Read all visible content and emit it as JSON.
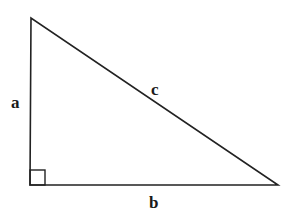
{
  "diagram": {
    "type": "right-triangle",
    "labels": {
      "a": "a",
      "b": "b",
      "c": "c"
    },
    "vertices": {
      "top": [
        31,
        18
      ],
      "right_angle": [
        30,
        185
      ],
      "right": [
        278,
        185
      ]
    },
    "stroke_color": "#222222",
    "right_angle_marker": true
  }
}
